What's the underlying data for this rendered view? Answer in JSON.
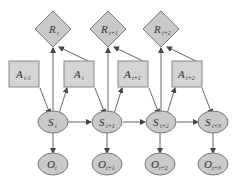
{
  "diagram": {
    "type": "dynamic-bayesian-network",
    "colors": {
      "node_fill": "#c9c9c9",
      "action_fill": "#d4d4d4",
      "stroke": "#777777",
      "edge": "#555555",
      "background": "#ffffff"
    },
    "rewards": [
      {
        "id": "R_t",
        "base": "R",
        "sub": "t"
      },
      {
        "id": "R_t+1",
        "base": "R",
        "sub": "t+1"
      },
      {
        "id": "R_t+2",
        "base": "R",
        "sub": "t+2"
      }
    ],
    "actions": [
      {
        "id": "A_t-1",
        "base": "A",
        "sub": "t-1"
      },
      {
        "id": "A_t",
        "base": "A",
        "sub": "t"
      },
      {
        "id": "A_t+1",
        "base": "A",
        "sub": "t+1"
      },
      {
        "id": "A_t+2",
        "base": "A",
        "sub": "t+2"
      }
    ],
    "states": [
      {
        "id": "S_t",
        "base": "S",
        "sub": "t"
      },
      {
        "id": "S_t+1",
        "base": "S",
        "sub": "t+1"
      },
      {
        "id": "S_t+2",
        "base": "S",
        "sub": "t+2"
      },
      {
        "id": "S_t+3",
        "base": "S",
        "sub": "t+3"
      }
    ],
    "observations": [
      {
        "id": "O_t",
        "base": "O",
        "sub": "t"
      },
      {
        "id": "O_t+1",
        "base": "O",
        "sub": "t+1"
      },
      {
        "id": "O_t+2",
        "base": "O",
        "sub": "t+2"
      },
      {
        "id": "O_t+3",
        "base": "O",
        "sub": "t+3"
      }
    ],
    "edges": [
      [
        "A_t-1",
        "S_t"
      ],
      [
        "S_t",
        "R_t"
      ],
      [
        "S_t",
        "A_t"
      ],
      [
        "A_t",
        "R_t"
      ],
      [
        "A_t",
        "S_t+1"
      ],
      [
        "S_t",
        "S_t+1"
      ],
      [
        "S_t",
        "O_t"
      ],
      [
        "S_t+1",
        "R_t+1"
      ],
      [
        "S_t+1",
        "A_t+1"
      ],
      [
        "A_t+1",
        "R_t+1"
      ],
      [
        "A_t+1",
        "S_t+2"
      ],
      [
        "S_t+1",
        "S_t+2"
      ],
      [
        "S_t+1",
        "O_t+1"
      ],
      [
        "S_t+2",
        "R_t+2"
      ],
      [
        "S_t+2",
        "A_t+2"
      ],
      [
        "A_t+2",
        "R_t+2"
      ],
      [
        "A_t+2",
        "S_t+3"
      ],
      [
        "S_t+2",
        "S_t+3"
      ],
      [
        "S_t+2",
        "O_t+2"
      ],
      [
        "S_t+3",
        "O_t+3"
      ]
    ]
  }
}
